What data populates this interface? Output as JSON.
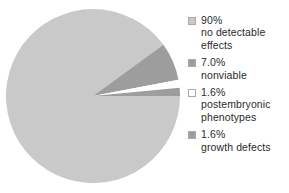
{
  "chart_data": {
    "type": "pie",
    "title": "",
    "subtitle": "",
    "xlabel": "",
    "ylabel": "",
    "legend_position": "right",
    "grid": false,
    "start_angle_deg": 0,
    "direction": "clockwise",
    "categories": [
      "no detectable effects",
      "nonviable",
      "postembryonic phenotypes",
      "growth defects"
    ],
    "values": [
      90,
      7.0,
      1.6,
      1.6
    ],
    "value_labels": [
      "90%",
      "7.0%",
      "1.6%",
      "1.6%"
    ],
    "colors": [
      "#c9c9c9",
      "#9d9d9d",
      "#ffffff",
      "#9d9d9d"
    ],
    "slices": [
      {
        "percent_label": "90%",
        "value": 90,
        "name": "no detectable effects",
        "color": "#c9c9c9",
        "start_deg": 0,
        "sweep_deg": 324.0
      },
      {
        "percent_label": "7.0%",
        "value": 7.0,
        "name": "nonviable",
        "color": "#9d9d9d",
        "start_deg": 324.0,
        "sweep_deg": 25.2
      },
      {
        "percent_label": "1.6%",
        "value": 1.6,
        "name": "postembryonic phenotypes",
        "color": "#ffffff",
        "start_deg": 349.2,
        "sweep_deg": 5.4
      },
      {
        "percent_label": "1.6%",
        "value": 1.6,
        "name": "growth defects",
        "color": "#9d9d9d",
        "start_deg": 354.6,
        "sweep_deg": 5.4
      }
    ]
  },
  "legend": {
    "items": [
      {
        "swatch_icon": "legend-swatch-icon",
        "color": "#c9c9c9",
        "percent": "90%",
        "line1": "no detectable",
        "line2": "effects"
      },
      {
        "swatch_icon": "legend-swatch-icon",
        "color": "#9d9d9d",
        "percent": "7.0%",
        "line1": "nonviable",
        "line2": ""
      },
      {
        "swatch_icon": "legend-swatch-icon",
        "color": "#ffffff",
        "percent": "1.6%",
        "line1": "postembryonic",
        "line2": "phenotypes"
      },
      {
        "swatch_icon": "legend-swatch-icon",
        "color": "#9d9d9d",
        "percent": "1.6%",
        "line1": "growth defects",
        "line2": ""
      }
    ]
  },
  "pie_geometry": {
    "center_x": 93,
    "center_y": 96,
    "radius": 87
  }
}
